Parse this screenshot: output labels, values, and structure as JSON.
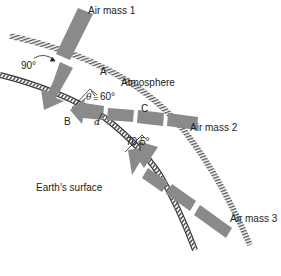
{
  "diagram": {
    "labels": {
      "air_mass_1": "Air mass 1",
      "air_mass_2": "Air mass 2",
      "air_mass_3": "Air mass 3",
      "atmosphere": "Atmosphere",
      "earths_surface": "Earth's surface",
      "point_a": "A",
      "point_b": "B",
      "point_c": "C",
      "angle_90": "90°",
      "angle_60": "60°",
      "angle_70_5": "70.5°",
      "theta": "θ",
      "theta_eq": "=",
      "alpha": "α"
    },
    "colors": {
      "arrow_fill": "#8c8c8c",
      "hatch": "#555555",
      "text": "#222222",
      "background": "#ffffff"
    }
  }
}
